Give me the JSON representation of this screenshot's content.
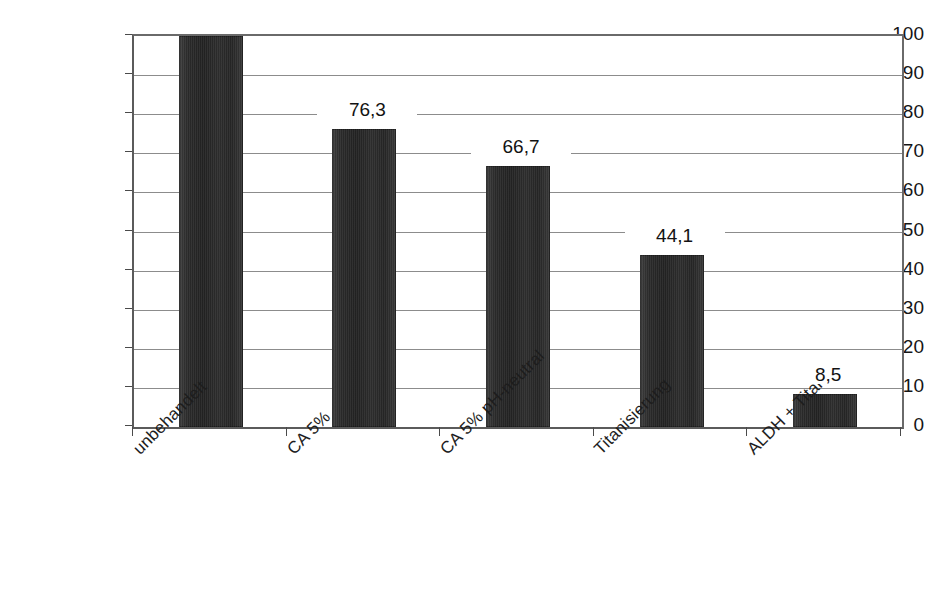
{
  "chart_data": {
    "type": "bar",
    "title": "",
    "xlabel": "",
    "ylabel": "Aldehydgehalt [%]",
    "ylim": [
      0,
      100
    ],
    "yticks": [
      "0",
      "10",
      "20",
      "30",
      "40",
      "50",
      "60",
      "70",
      "80",
      "90",
      "100"
    ],
    "grid": true,
    "legend": "none",
    "decimal_separator": ",",
    "categories": [
      "unbehandelt",
      "CA 5%",
      "CA 5% pH-neutral",
      "Titanisierung",
      "ALDH + Titan"
    ],
    "values": [
      100,
      76.3,
      66.7,
      44.1,
      8.5
    ],
    "value_labels": [
      "",
      "76,3",
      "66,7",
      "44,1",
      "8,5"
    ],
    "bar_color": "#2b2b2b",
    "gridline_color": "#8c8c8c",
    "axis_color": "#5b5b5b",
    "background_color": "#ffffff"
  }
}
